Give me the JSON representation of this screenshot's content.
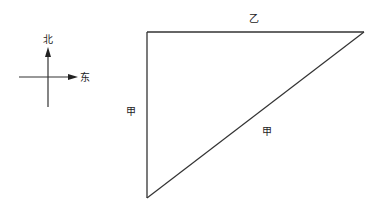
{
  "compass": {
    "north_label": "北",
    "east_label": "东"
  },
  "triangle": {
    "top_side_label": "乙",
    "left_side_label": "甲",
    "hypotenuse_label": "甲",
    "vertices": {
      "top_left": [
        147,
        32
      ],
      "top_right": [
        364,
        32
      ],
      "bottom": [
        147,
        198
      ]
    }
  },
  "colors": {
    "line": "#333333",
    "text": "#222222",
    "background": "#ffffff"
  }
}
